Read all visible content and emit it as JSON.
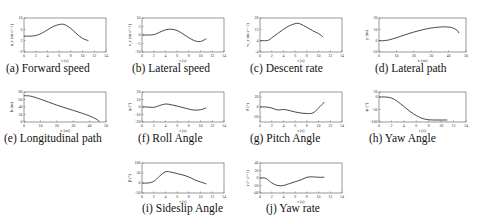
{
  "figure": {
    "captions": [
      "(a) Forward speed",
      "(b) Lateral speed",
      "(c) Descent rate",
      "(d) Lateral path",
      "(e) Longitudinal path",
      "(f) Roll Angle",
      "(g) Pitch Angle",
      "(h) Yaw Angle",
      "(i) Sideslip Angle",
      "(j) Yaw rate"
    ]
  },
  "chart_data": [
    {
      "id": "a",
      "type": "line",
      "title": "(a) Forward speed",
      "xlabel": "t (s)",
      "ylabel": "u_r (m s^-1)",
      "xlim": [
        0,
        14
      ],
      "ylim": [
        -2,
        10
      ],
      "xticks": [
        "0",
        "2",
        "4",
        "6",
        "8",
        "10",
        "12",
        "14"
      ],
      "yticks": [
        "-2",
        "2",
        "6",
        "10"
      ],
      "x": [
        0,
        1,
        2,
        3,
        4,
        5,
        6,
        6.5,
        7,
        8,
        9,
        10,
        11
      ],
      "y": [
        3.6,
        3.6,
        3.8,
        4.6,
        5.8,
        7.0,
        7.7,
        7.8,
        7.6,
        6.3,
        4.4,
        2.8,
        2.0
      ]
    },
    {
      "id": "b",
      "type": "line",
      "title": "(b) Lateral speed",
      "xlabel": "t (s)",
      "ylabel": "v_r (m s^-1)",
      "xlim": [
        0,
        14
      ],
      "ylim": [
        -10,
        10
      ],
      "xticks": [
        "0",
        "2",
        "4",
        "6",
        "8",
        "10",
        "12",
        "14"
      ],
      "yticks": [
        "-10",
        "-5",
        "0",
        "5",
        "10"
      ],
      "x": [
        0,
        1,
        2,
        3,
        4,
        5,
        6,
        7,
        8,
        9,
        10,
        11
      ],
      "y": [
        0,
        0,
        0.2,
        1.6,
        3.0,
        3.4,
        2.6,
        0.6,
        -1.6,
        -3.4,
        -3.8,
        -2.2
      ]
    },
    {
      "id": "c",
      "type": "line",
      "title": "(c) Descent rate",
      "xlabel": "t (s)",
      "ylabel": "w_r (m s^-1)",
      "xlim": [
        0,
        14
      ],
      "ylim": [
        -4,
        20
      ],
      "xticks": [
        "0",
        "2",
        "4",
        "6",
        "8",
        "10",
        "12",
        "14"
      ],
      "yticks": [
        "-4",
        "4",
        "12",
        "20"
      ],
      "x": [
        0,
        1,
        1.5,
        2,
        3,
        4,
        5,
        6,
        6.5,
        7,
        8,
        9,
        10,
        10.8
      ],
      "y": [
        4,
        4,
        4.4,
        6,
        9,
        12,
        14.5,
        16,
        16.2,
        15.6,
        13.4,
        11,
        9,
        6.5
      ]
    },
    {
      "id": "d",
      "type": "line",
      "title": "(d) Lateral path",
      "xlabel": "x (m)",
      "ylabel": "y (m)",
      "xlim": [
        0,
        50
      ],
      "ylim": [
        -10,
        20
      ],
      "xticks": [
        "0",
        "10",
        "20",
        "30",
        "40",
        "50"
      ],
      "yticks": [
        "-10",
        "0",
        "10",
        "20"
      ],
      "x": [
        0,
        3,
        6,
        10,
        15,
        20,
        25,
        30,
        35,
        38,
        41,
        43,
        45,
        46
      ],
      "y": [
        0,
        0,
        0.8,
        2.6,
        5.2,
        7.6,
        9.6,
        11.2,
        12,
        12.2,
        11.8,
        10.8,
        9,
        6.6
      ]
    },
    {
      "id": "e",
      "type": "line",
      "title": "(e) Longitudinal path",
      "xlabel": "x (m)",
      "ylabel": "h (m)",
      "xlim": [
        0,
        50
      ],
      "ylim": [
        0,
        80
      ],
      "xticks": [
        "0",
        "10",
        "20",
        "30",
        "40",
        "50"
      ],
      "yticks": [
        "0",
        "20",
        "40",
        "60",
        "80"
      ],
      "x": [
        0,
        2,
        5,
        10,
        15,
        20,
        25,
        30,
        35,
        40,
        44,
        46
      ],
      "y": [
        70,
        70,
        68,
        61,
        53,
        45,
        38,
        31,
        24,
        16,
        8,
        1
      ]
    },
    {
      "id": "f",
      "type": "line",
      "title": "(f) Roll Angle",
      "xlabel": "t (s)",
      "ylabel": "φ (°)",
      "xlim": [
        0,
        14
      ],
      "ylim": [
        -20,
        20
      ],
      "xticks": [
        "0",
        "2",
        "4",
        "6",
        "8",
        "10",
        "12",
        "14"
      ],
      "yticks": [
        "-20",
        "-10",
        "0",
        "10",
        "20"
      ],
      "x": [
        0,
        1,
        2,
        3,
        4,
        5,
        6,
        7,
        8,
        9,
        10,
        11
      ],
      "y": [
        0,
        0,
        -0.5,
        2,
        4,
        3,
        1.2,
        -0.8,
        -2.8,
        -4.2,
        -3.6,
        -1.2
      ]
    },
    {
      "id": "g",
      "type": "line",
      "title": "(g) Pitch Angle",
      "xlabel": "t (s)",
      "ylabel": "θ (°)",
      "xlim": [
        0,
        14
      ],
      "ylim": [
        -30,
        30
      ],
      "xticks": [
        "0",
        "2",
        "4",
        "6",
        "8",
        "10",
        "12",
        "14"
      ],
      "yticks": [
        "-20",
        "0",
        "20"
      ],
      "x": [
        0,
        1,
        2,
        3,
        4,
        5,
        6,
        7,
        8,
        9,
        10,
        11
      ],
      "y": [
        0,
        0,
        -2,
        -6,
        -5,
        -7,
        -10,
        -12,
        -13,
        -12,
        -2,
        10
      ]
    },
    {
      "id": "h",
      "type": "line",
      "title": "(h) Yaw Angle",
      "xlabel": "t (s)",
      "ylabel": "ψ (°)",
      "xlim": [
        0,
        14
      ],
      "ylim": [
        -100,
        20
      ],
      "xticks": [
        "0",
        "2",
        "4",
        "6",
        "8",
        "10",
        "12",
        "14"
      ],
      "yticks": [
        "-100",
        "-50",
        "0",
        "20"
      ],
      "x": [
        0,
        1,
        2,
        3,
        4,
        5,
        6,
        7,
        8,
        9,
        10,
        11
      ],
      "y": [
        0,
        0,
        -4,
        -18,
        -38,
        -58,
        -74,
        -86,
        -91,
        -92,
        -92,
        -92
      ]
    },
    {
      "id": "i",
      "type": "line",
      "title": "(i) Sideslip Angle",
      "xlabel": "t (s)",
      "ylabel": "β (°)",
      "xlim": [
        0,
        14
      ],
      "ylim": [
        -50,
        100
      ],
      "xticks": [
        "0",
        "2",
        "4",
        "6",
        "8",
        "10",
        "12",
        "14"
      ],
      "yticks": [
        "-50",
        "0",
        "50",
        "100"
      ],
      "x": [
        0,
        1,
        2,
        3,
        4,
        5,
        6,
        7,
        8,
        9,
        10,
        11
      ],
      "y": [
        0,
        0,
        8,
        34,
        56,
        54,
        47,
        40,
        30,
        16,
        5,
        -4
      ]
    },
    {
      "id": "j",
      "type": "line",
      "title": "(j) Yaw rate",
      "xlabel": "t (s)",
      "ylabel": "r (° s^-1)",
      "xlim": [
        0,
        14
      ],
      "ylim": [
        -40,
        40
      ],
      "xticks": [
        "0",
        "2",
        "4",
        "6",
        "8",
        "10",
        "12",
        "14"
      ],
      "yticks": [
        "-40",
        "-20",
        "0",
        "20",
        "40"
      ],
      "x": [
        0,
        1,
        2,
        3,
        4,
        5,
        6,
        7,
        8,
        9,
        10,
        11
      ],
      "y": [
        0,
        -1,
        -13,
        -20,
        -20,
        -15,
        -10,
        -5,
        2,
        3,
        2,
        2
      ]
    }
  ]
}
